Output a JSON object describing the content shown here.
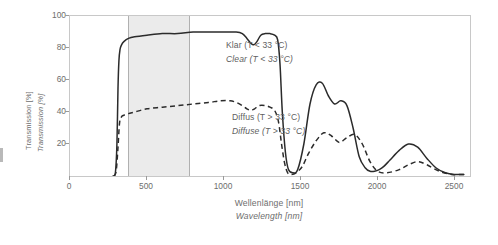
{
  "chart_data": {
    "type": "line",
    "title": "",
    "xlabel": "Wellenlänge [nm]",
    "xlabel_en": "Wavelength [nm]",
    "ylabel": "Transmission [%]",
    "ylabel_en": "Transmission [%]",
    "xlim": [
      0,
      2600
    ],
    "ylim": [
      0,
      100
    ],
    "xticks": [
      0,
      500,
      1000,
      1500,
      2000,
      2500
    ],
    "xtick_labels": [
      "0",
      "500",
      "1000",
      "1500",
      "2000",
      "2500"
    ],
    "yticks": [
      0,
      20,
      40,
      60,
      80,
      100
    ],
    "ytick_labels": [
      "0",
      "20",
      "40",
      "60",
      "80",
      "100"
    ],
    "grid": false,
    "legend_position": "inside-annotations",
    "shaded_region": {
      "name": "visible-spectrum-band",
      "x_start": 380,
      "x_end": 780,
      "color": "#ebebeb"
    },
    "series": [
      {
        "name": "Klar (T < 33 °C)",
        "name_en": "Clear (T < 33 °C)",
        "style": "solid",
        "color": "#2b2b2b",
        "x": [
          280,
          295,
          305,
          312,
          318,
          325,
          335,
          350,
          380,
          420,
          500,
          600,
          700,
          800,
          900,
          1000,
          1080,
          1120,
          1150,
          1175,
          1195,
          1215,
          1240,
          1270,
          1300,
          1330,
          1350,
          1365,
          1380,
          1400,
          1420,
          1450,
          1480,
          1520,
          1560,
          1600,
          1640,
          1680,
          1720,
          1760,
          1800,
          1840,
          1880,
          1920,
          1950,
          1980,
          2010,
          2040,
          2080,
          2140,
          2200,
          2260,
          2320,
          2380,
          2440,
          2500,
          2560
        ],
        "y": [
          0,
          2,
          20,
          55,
          72,
          79,
          82,
          84,
          86,
          87,
          88,
          89,
          89,
          90,
          90,
          90,
          90,
          89,
          86,
          83,
          82,
          84,
          88,
          89,
          89,
          88,
          85,
          70,
          40,
          15,
          4,
          2,
          4,
          20,
          45,
          57,
          58,
          50,
          45,
          47,
          44,
          30,
          12,
          5,
          3,
          3,
          4,
          6,
          10,
          16,
          20,
          18,
          11,
          5,
          2,
          1,
          1
        ]
      },
      {
        "name": "Diffus (T > 33 °C)",
        "name_en": "Diffuse (T > 33 °C)",
        "style": "dashed",
        "color": "#2b2b2b",
        "x": [
          285,
          300,
          312,
          322,
          335,
          350,
          380,
          420,
          500,
          600,
          700,
          800,
          900,
          980,
          1040,
          1080,
          1120,
          1150,
          1175,
          1200,
          1230,
          1270,
          1300,
          1330,
          1355,
          1375,
          1395,
          1415,
          1440,
          1470,
          1510,
          1550,
          1600,
          1650,
          1700,
          1750,
          1800,
          1850,
          1900,
          1950,
          2000,
          2060,
          2140,
          2200,
          2260,
          2320,
          2400,
          2480,
          2560
        ],
        "y": [
          0,
          3,
          18,
          33,
          37,
          38,
          39,
          40,
          42,
          43,
          44,
          45,
          46,
          47,
          47,
          46,
          44,
          42,
          41,
          42,
          44,
          44,
          43,
          41,
          34,
          20,
          8,
          2,
          1,
          2,
          6,
          14,
          22,
          27,
          25,
          21,
          24,
          26,
          20,
          9,
          3,
          2,
          4,
          7,
          9,
          7,
          3,
          1,
          1
        ]
      }
    ],
    "annotations": [
      {
        "name": "legend-clear-de",
        "text": "Klar (T < 33 °C)",
        "italic": false
      },
      {
        "name": "legend-clear-en",
        "text": "Clear (T < 33 °C)",
        "italic": true
      },
      {
        "name": "legend-diffuse-de",
        "text": "Diffus (T > 33 °C)",
        "italic": false
      },
      {
        "name": "legend-diffuse-en",
        "text": "Diffuse (T > 33 °C)",
        "italic": true
      }
    ]
  },
  "axes": {
    "y_title_de": "Transmission [%]",
    "y_title_en": "Transmission [%]",
    "x_title_de": "Wellenlänge [nm]",
    "x_title_en": "Wavelength [nm]",
    "y_labels": [
      "100",
      "80",
      "60",
      "40",
      "20",
      "0"
    ],
    "x_labels": [
      "0",
      "500",
      "1000",
      "1500",
      "2000",
      "2500"
    ]
  },
  "colors": {
    "frame": "#c8c8c8",
    "band": "#ebebeb",
    "band_edge": "#b0b0b0",
    "curve": "#2b2b2b",
    "text": "#6d6d6d"
  }
}
